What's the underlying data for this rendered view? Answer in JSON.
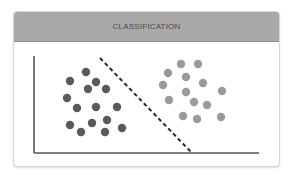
{
  "card": {
    "title": "CLASSIFICATION"
  },
  "colors": {
    "header_bg": "#a9a9a9",
    "class_a": "#5a5a5a",
    "class_b": "#9a9a9a",
    "axis": "#555555",
    "boundary": "#2a2a2a"
  },
  "diagram": {
    "axes": {
      "origin": [
        34,
        153
      ],
      "y_axis_top": [
        34,
        56
      ],
      "x_axis_end": [
        259,
        153
      ]
    },
    "decision_boundary": {
      "style": "dashed",
      "from": [
        100,
        58
      ],
      "to": [
        192,
        153
      ]
    },
    "class_a_points": [
      [
        86,
        72
      ],
      [
        70,
        81
      ],
      [
        96,
        82
      ],
      [
        88,
        89
      ],
      [
        106,
        89
      ],
      [
        67,
        98
      ],
      [
        77,
        108
      ],
      [
        96,
        107
      ],
      [
        117,
        107
      ],
      [
        70,
        125
      ],
      [
        92,
        123
      ],
      [
        107,
        120
      ],
      [
        81,
        132
      ],
      [
        105,
        132
      ],
      [
        122,
        128
      ]
    ],
    "class_b_points": [
      [
        181,
        64
      ],
      [
        198,
        64
      ],
      [
        168,
        73
      ],
      [
        186,
        77
      ],
      [
        203,
        83
      ],
      [
        163,
        85
      ],
      [
        186,
        92
      ],
      [
        222,
        91
      ],
      [
        169,
        100
      ],
      [
        194,
        102
      ],
      [
        207,
        105
      ],
      [
        183,
        116
      ],
      [
        197,
        119
      ],
      [
        221,
        117
      ]
    ]
  }
}
